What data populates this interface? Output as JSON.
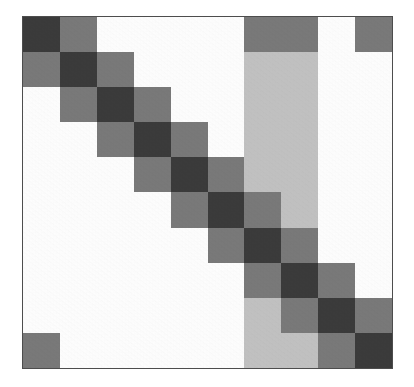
{
  "figure": {
    "title": "",
    "background_color": "#ffffff",
    "border_color": "#4d4d4d",
    "alt_description": "Grayscale block-diagonal matrix heatmap, 10 by 10 cells"
  },
  "palette": {
    "white": "#ffffff",
    "light_gray": "#c3c3c3",
    "medium_gray": "#7a7a7a",
    "dark_gray": "#3b3b3b"
  },
  "chart_data": {
    "type": "heatmap",
    "title": "",
    "subtitle": "",
    "xlabel": "",
    "ylabel": "",
    "grid": false,
    "legend": "none",
    "colormap": "grays",
    "nrows": 10,
    "ncols": 10,
    "value_levels": {
      "0": "white",
      "1": "light_gray",
      "2": "medium_gray",
      "3": "dark_gray"
    },
    "level_colors": [
      "#ffffff",
      "#c3c3c3",
      "#7a7a7a",
      "#3b3b3b"
    ],
    "x": [
      "1",
      "2",
      "3",
      "4",
      "5",
      "6",
      "7",
      "8",
      "9",
      "10"
    ],
    "categories": [
      "1",
      "2",
      "3",
      "4",
      "5",
      "6",
      "7",
      "8",
      "9",
      "10"
    ],
    "row_labels": [
      "1",
      "2",
      "3",
      "4",
      "5",
      "6",
      "7",
      "8",
      "9",
      "10"
    ],
    "col_labels": [
      "1",
      "2",
      "3",
      "4",
      "5",
      "6",
      "7",
      "8",
      "9",
      "10"
    ],
    "values": [
      [
        3,
        2,
        0,
        0,
        0,
        0,
        2,
        2,
        0,
        2
      ],
      [
        2,
        3,
        2,
        0,
        0,
        0,
        1,
        1,
        0,
        0
      ],
      [
        0,
        2,
        3,
        2,
        0,
        0,
        1,
        1,
        0,
        0
      ],
      [
        0,
        0,
        2,
        3,
        2,
        0,
        1,
        1,
        0,
        0
      ],
      [
        0,
        0,
        0,
        2,
        3,
        2,
        1,
        1,
        0,
        0
      ],
      [
        0,
        0,
        0,
        0,
        2,
        3,
        2,
        1,
        0,
        0
      ],
      [
        0,
        0,
        0,
        0,
        0,
        2,
        3,
        2,
        0,
        0
      ],
      [
        0,
        0,
        0,
        0,
        0,
        0,
        2,
        3,
        2,
        0
      ],
      [
        0,
        0,
        0,
        0,
        0,
        0,
        1,
        2,
        3,
        2
      ],
      [
        2,
        0,
        0,
        0,
        0,
        0,
        1,
        1,
        2,
        3
      ]
    ],
    "annotations": []
  }
}
